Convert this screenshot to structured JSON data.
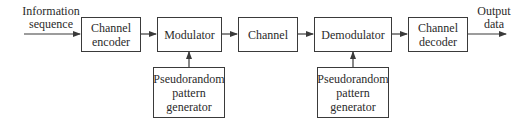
{
  "diagram": {
    "input_label": "Information sequence",
    "input_lines": [
      "Information",
      "sequence"
    ],
    "output_lines": [
      "Output",
      "data"
    ],
    "blocks": {
      "channel_encoder": "Channel encoder",
      "modulator": "Modulator",
      "channel": "Channel",
      "demodulator": "Demodulator",
      "channel_decoder": "Channel decoder",
      "pn_generator_tx": "Pseudorandom pattern generator",
      "pn_generator_rx": "Pseudorandom pattern generator"
    },
    "block_lines": {
      "channel_encoder": [
        "Channel",
        "encoder"
      ],
      "channel_decoder": [
        "Channel",
        "decoder"
      ],
      "pn_generator_tx": [
        "Pseudorandom",
        "pattern",
        "generator"
      ],
      "pn_generator_rx": [
        "Pseudorandom",
        "pattern",
        "generator"
      ]
    },
    "line_color": "#3a3a3a"
  }
}
